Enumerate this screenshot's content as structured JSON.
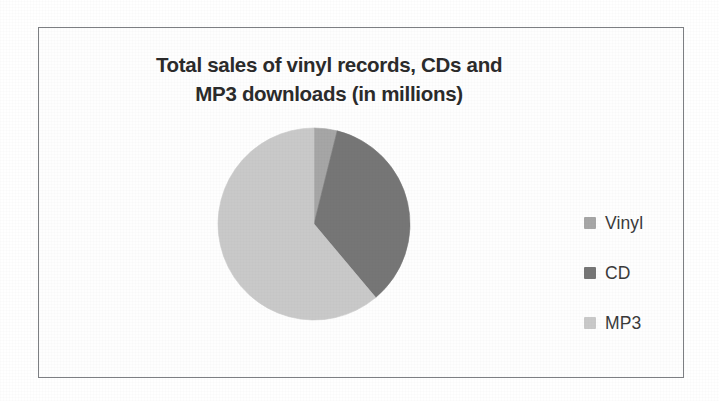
{
  "chart_data": {
    "type": "pie",
    "title": "Total sales of vinyl records, CDs and MP3 downloads (in millions)",
    "title_lines": [
      "Total sales of vinyl records, CDs and",
      "MP3 downloads (in millions)"
    ],
    "xlabel": "",
    "ylabel": "",
    "grid": false,
    "legend_position": "right",
    "data_labels_shown": false,
    "start_angle_deg": 0,
    "direction": "clockwise",
    "categories": [
      "Vinyl",
      "CD",
      "MP3"
    ],
    "values": [
      4,
      35,
      61
    ],
    "units": "millions",
    "slices": [
      {
        "label": "Vinyl",
        "value": 4,
        "percent": 4,
        "start_deg": 0,
        "end_deg": 14,
        "color": "#a6a6a6"
      },
      {
        "label": "CD",
        "value": 35,
        "percent": 35,
        "start_deg": 14,
        "end_deg": 140,
        "color": "#767676"
      },
      {
        "label": "MP3",
        "value": 61,
        "percent": 61,
        "start_deg": 140,
        "end_deg": 360,
        "color": "#c9c9c9"
      }
    ]
  },
  "legend": {
    "items": [
      {
        "label": "Vinyl",
        "marker": "legend-swatch-square",
        "color": "#a6a6a6"
      },
      {
        "label": "CD",
        "marker": "legend-swatch-square",
        "color": "#767676"
      },
      {
        "label": "MP3",
        "marker": "legend-swatch-square",
        "color": "#c9c9c9"
      }
    ]
  },
  "frame": {
    "border_color": "#7d7f83",
    "background": "#fefefe"
  }
}
